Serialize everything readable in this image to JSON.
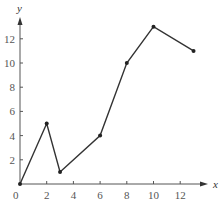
{
  "chart_data": {
    "type": "line",
    "title": "",
    "xlabel": "x",
    "ylabel": "y",
    "x": [
      0,
      2,
      3,
      6,
      8,
      10,
      13
    ],
    "series": [
      {
        "name": "",
        "values": [
          0,
          5,
          1,
          4,
          10,
          13,
          11
        ]
      }
    ],
    "x_ticks": [
      2,
      4,
      6,
      8,
      10,
      12
    ],
    "y_ticks": [
      2,
      4,
      6,
      8,
      10,
      12
    ],
    "origin_label": "0",
    "xlim": [
      0,
      14
    ],
    "ylim": [
      0,
      13.8
    ],
    "grid": false,
    "legend": "none",
    "markers": true
  },
  "colors": {
    "axis": "#555555",
    "line": "#333333",
    "marker": "#222222"
  }
}
